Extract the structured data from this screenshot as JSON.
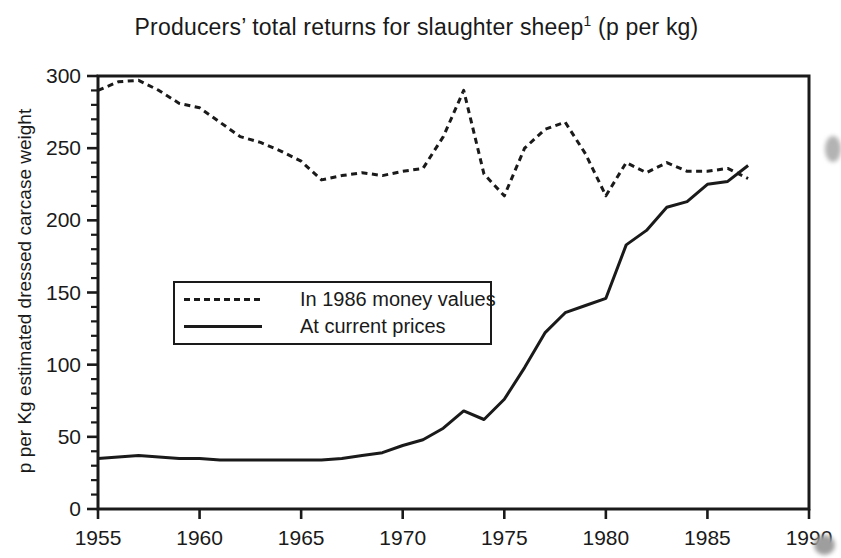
{
  "title": {
    "main": "Producers’ total returns for slaughter sheep",
    "superscript": "1",
    "suffix": " (p per kg)"
  },
  "colors": {
    "ink": "#1a1a1a",
    "background": "#ffffff"
  },
  "chart_data": {
    "type": "line",
    "xlabel": "",
    "ylabel": "p per Kg estimated dressed carcase weight",
    "xlim": [
      1955,
      1990
    ],
    "ylim": [
      0,
      300
    ],
    "x_ticks": [
      1955,
      1960,
      1965,
      1970,
      1975,
      1980,
      1985,
      1990
    ],
    "y_ticks": [
      0,
      50,
      100,
      150,
      200,
      250,
      300
    ],
    "y_minor_step": 10,
    "grid": false,
    "frame": true,
    "legend_position": "inside upper-left",
    "x": [
      1955,
      1956,
      1957,
      1958,
      1959,
      1960,
      1961,
      1962,
      1963,
      1964,
      1965,
      1966,
      1967,
      1968,
      1969,
      1970,
      1971,
      1972,
      1973,
      1974,
      1975,
      1976,
      1977,
      1978,
      1979,
      1980,
      1981,
      1982,
      1983,
      1984,
      1985,
      1986,
      1987
    ],
    "series": [
      {
        "name": "In 1986 money values",
        "style": "dashed",
        "values": [
          290,
          296,
          297,
          290,
          281,
          278,
          268,
          258,
          254,
          248,
          241,
          228,
          231,
          233,
          231,
          234,
          236,
          258,
          290,
          232,
          217,
          250,
          263,
          268,
          246,
          217,
          240,
          233,
          240,
          234,
          234,
          236,
          229
        ]
      },
      {
        "name": "At current prices",
        "style": "solid",
        "values": [
          35,
          36,
          37,
          36,
          35,
          35,
          34,
          34,
          34,
          34,
          34,
          34,
          35,
          37,
          39,
          44,
          48,
          56,
          68,
          62,
          76,
          98,
          122,
          136,
          141,
          146,
          183,
          193,
          209,
          213,
          225,
          227,
          238
        ]
      }
    ]
  }
}
